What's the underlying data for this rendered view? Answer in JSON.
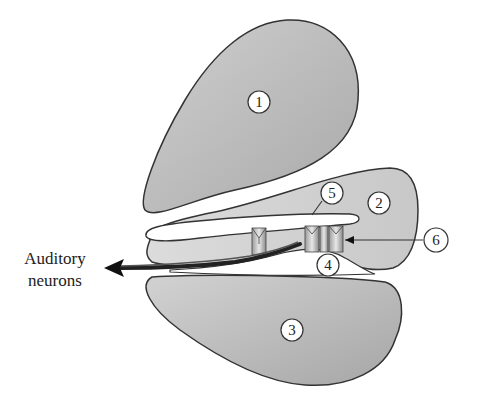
{
  "diagram": {
    "colors": {
      "fill_dark": "#b8b8b8",
      "fill_light": "#d6d6d6",
      "outline": "#333333",
      "background": "#ffffff"
    },
    "labels": [
      {
        "id": "1",
        "text": "1",
        "x": 259,
        "y": 102
      },
      {
        "id": "2",
        "text": "2",
        "x": 379,
        "y": 203
      },
      {
        "id": "3",
        "text": "3",
        "x": 292,
        "y": 330
      },
      {
        "id": "4",
        "text": "4",
        "x": 328,
        "y": 265
      },
      {
        "id": "5",
        "text": "5",
        "x": 332,
        "y": 193
      },
      {
        "id": "6",
        "text": "6",
        "x": 436,
        "y": 240
      }
    ],
    "side_label": {
      "line1": "Auditory",
      "line2": "neurons"
    }
  }
}
